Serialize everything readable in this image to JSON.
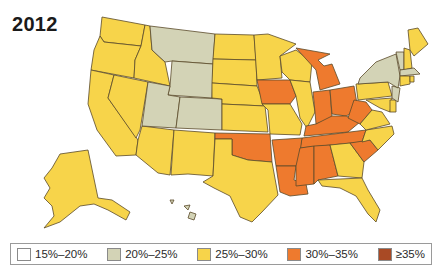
{
  "title": "2012",
  "colors": {
    "c15_20": "#ffffff",
    "c20_25": "#d3d3b6",
    "c25_30": "#f7d44a",
    "c30_35": "#ee7a2e",
    "c35": "#a94a25",
    "border": "#5a4a2a"
  },
  "legend": [
    {
      "label": "15%–20%",
      "color": "#ffffff"
    },
    {
      "label": "20%–25%",
      "color": "#d3d3b6"
    },
    {
      "label": "25%–30%",
      "color": "#f7d44a"
    },
    {
      "label": "30%–35%",
      "color": "#ee7a2e"
    },
    {
      "label": "≥35%",
      "color": "#a94a25"
    }
  ],
  "states": {
    "20%-25%": [
      "Montana",
      "Wyoming",
      "Utah",
      "Colorado",
      "New York",
      "Vermont",
      "Massachusetts",
      "New Jersey",
      "Hawaii"
    ],
    "25%-30%": [
      "Washington",
      "Oregon",
      "California",
      "Nevada",
      "Idaho",
      "Arizona",
      "New Mexico",
      "Texas",
      "North Dakota",
      "South Dakota",
      "Nebraska",
      "Kansas",
      "Minnesota",
      "Wisconsin",
      "Illinois",
      "Missouri",
      "Pennsylvania",
      "Maryland",
      "Delaware",
      "Virginia",
      "North Carolina",
      "Georgia",
      "Florida",
      "Maine",
      "New Hampshire",
      "Connecticut",
      "Rhode Island",
      "Alaska"
    ],
    "30%-35%": [
      "Oklahoma",
      "Iowa",
      "Arkansas",
      "Louisiana",
      "Mississippi",
      "Alabama",
      "Tennessee",
      "Kentucky",
      "Indiana",
      "Ohio",
      "Michigan",
      "West Virginia",
      "South Carolina"
    ]
  }
}
